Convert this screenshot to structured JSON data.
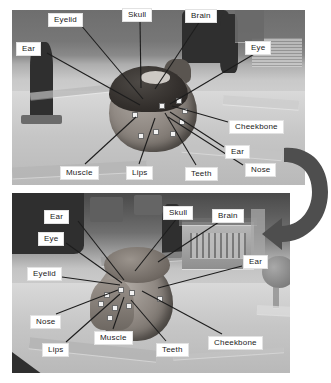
{
  "figure": {
    "panel_count": 2,
    "arrow": {
      "name": "curved-arrow",
      "direction": "clockwise-down",
      "color": "#4a4a4a"
    }
  },
  "panels": [
    {
      "id": "top",
      "description": "Grayscale photograph of a clay anatomical head model on a wooden table with a dark standing figurine at left, viewed from the front-left",
      "labels": [
        {
          "text": "Eyelid",
          "x": 48,
          "y": 13
        },
        {
          "text": "Skull",
          "x": 122,
          "y": 8
        },
        {
          "text": "Brain",
          "x": 185,
          "y": 9
        },
        {
          "text": "Ear",
          "x": 16,
          "y": 42
        },
        {
          "text": "Eye",
          "x": 245,
          "y": 41
        },
        {
          "text": "Cheekbone",
          "x": 229,
          "y": 120
        },
        {
          "text": "Ear",
          "x": 225,
          "y": 145
        },
        {
          "text": "Nose",
          "x": 245,
          "y": 163
        },
        {
          "text": "Muscle",
          "x": 60,
          "y": 166
        },
        {
          "text": "Lips",
          "x": 126,
          "y": 166
        },
        {
          "text": "Teeth",
          "x": 185,
          "y": 167
        }
      ]
    },
    {
      "id": "bottom",
      "description": "Grayscale photograph of the same clay head model from a different angle, with a model building and workshop clutter in the background",
      "labels": [
        {
          "text": "Ear",
          "x": 44,
          "y": 210
        },
        {
          "text": "Skull",
          "x": 163,
          "y": 206
        },
        {
          "text": "Brain",
          "x": 212,
          "y": 209
        },
        {
          "text": "Eye",
          "x": 38,
          "y": 232
        },
        {
          "text": "Ear",
          "x": 243,
          "y": 255
        },
        {
          "text": "Eyelid",
          "x": 27,
          "y": 267
        },
        {
          "text": "Nose",
          "x": 30,
          "y": 315
        },
        {
          "text": "Muscle",
          "x": 94,
          "y": 331
        },
        {
          "text": "Lips",
          "x": 42,
          "y": 343
        },
        {
          "text": "Teeth",
          "x": 156,
          "y": 343
        },
        {
          "text": "Cheekbone",
          "x": 208,
          "y": 336
        }
      ]
    }
  ]
}
